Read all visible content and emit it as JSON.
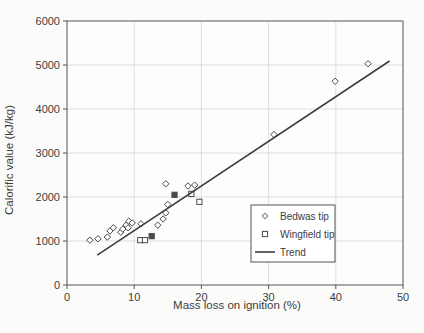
{
  "figure": {
    "background": "#fbfbfa"
  },
  "chart_data": {
    "type": "scatter",
    "title": "",
    "xlabel": "Mass loss on ignition (%)",
    "ylabel": "Calorific value (kJ/kg)",
    "xlim": [
      0,
      50
    ],
    "ylim": [
      0,
      6000
    ],
    "x_ticks": [
      0,
      10,
      20,
      30,
      40,
      50
    ],
    "y_ticks": [
      0,
      1000,
      2000,
      3000,
      4000,
      5000,
      6000
    ],
    "grid": true,
    "legend": {
      "position": "inside-lower-right",
      "entries": [
        {
          "label": "Bedwas tip",
          "marker": "diamond"
        },
        {
          "label": "Wingfield tip",
          "marker": "square"
        },
        {
          "label": "Trend",
          "marker": "line"
        }
      ]
    },
    "series": [
      {
        "name": "Bedwas tip",
        "marker": "diamond",
        "points": [
          [
            3.4,
            1020
          ],
          [
            4.6,
            1050
          ],
          [
            6.0,
            1090
          ],
          [
            6.4,
            1230
          ],
          [
            6.9,
            1300
          ],
          [
            8.0,
            1200
          ],
          [
            8.3,
            1270
          ],
          [
            8.8,
            1360
          ],
          [
            9.1,
            1300
          ],
          [
            9.2,
            1450
          ],
          [
            9.7,
            1410
          ],
          [
            11.0,
            1390
          ],
          [
            13.5,
            1360
          ],
          [
            14.3,
            1500
          ],
          [
            14.7,
            1640
          ],
          [
            15.0,
            1830
          ],
          [
            14.7,
            2300
          ],
          [
            18.0,
            2250
          ],
          [
            19.0,
            2270
          ],
          [
            30.8,
            3420
          ],
          [
            39.9,
            4630
          ],
          [
            44.8,
            5030
          ]
        ]
      },
      {
        "name": "Wingfield tip",
        "marker": "square",
        "points": [
          [
            10.9,
            1020
          ],
          [
            11.6,
            1020
          ],
          [
            12.6,
            1110,
            1
          ],
          [
            16.0,
            2050,
            1
          ],
          [
            18.5,
            2070
          ],
          [
            19.7,
            1890
          ]
        ]
      },
      {
        "name": "Trend",
        "marker": "line",
        "points": [
          [
            4.5,
            680
          ],
          [
            48.0,
            5090
          ]
        ]
      }
    ],
    "colors": {
      "marker": "#4a4a4a",
      "trend": "#3d3d3d",
      "grid": "#dededc",
      "frame": "#555555",
      "text": "#3d3d3d",
      "plot_bg": "#fdfdfc"
    }
  }
}
